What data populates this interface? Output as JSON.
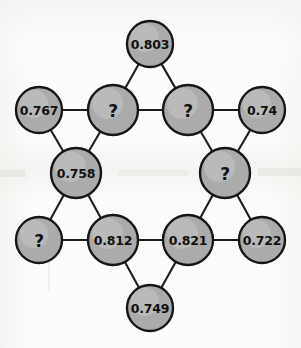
{
  "figure": {
    "background_color": "#fcfcfb",
    "node_fill_color": "#ababab",
    "node_stroke_color": "#161616",
    "edge_color": "#1d1d1d",
    "unknown_marker": "?"
  },
  "chart_data": {
    "type": "diagram",
    "layout": "hexagram",
    "node_count": 12,
    "edge_count": 12,
    "unknown_count": 4,
    "known_count": 8,
    "nodes": [
      {
        "id": "top",
        "label": "0.803",
        "value": 0.803,
        "known": true,
        "cx": 150,
        "cy": 44,
        "r": 23
      },
      {
        "id": "upper-left",
        "label": "0.767",
        "value": 0.767,
        "known": true,
        "cx": 39,
        "cy": 110,
        "r": 23
      },
      {
        "id": "upper-mid-l",
        "label": "?",
        "value": null,
        "known": false,
        "cx": 113,
        "cy": 110,
        "r": 25
      },
      {
        "id": "upper-mid-r",
        "label": "?",
        "value": null,
        "known": false,
        "cx": 188,
        "cy": 110,
        "r": 25
      },
      {
        "id": "upper-right",
        "label": "0.74",
        "value": 0.74,
        "known": true,
        "cx": 262,
        "cy": 110,
        "r": 23
      },
      {
        "id": "mid-left",
        "label": "0.758",
        "value": 0.758,
        "known": true,
        "cx": 76,
        "cy": 173,
        "r": 25
      },
      {
        "id": "mid-right",
        "label": "?",
        "value": null,
        "known": false,
        "cx": 225,
        "cy": 173,
        "r": 25
      },
      {
        "id": "lower-left",
        "label": "?",
        "value": null,
        "known": false,
        "cx": 39,
        "cy": 240,
        "r": 23
      },
      {
        "id": "lower-mid-l",
        "label": "0.812",
        "value": 0.812,
        "known": true,
        "cx": 113,
        "cy": 240,
        "r": 25
      },
      {
        "id": "lower-mid-r",
        "label": "0.821",
        "value": 0.821,
        "known": true,
        "cx": 188,
        "cy": 240,
        "r": 25
      },
      {
        "id": "lower-right",
        "label": "0.722",
        "value": 0.722,
        "known": true,
        "cx": 262,
        "cy": 240,
        "r": 23
      },
      {
        "id": "bottom",
        "label": "0.749",
        "value": 0.749,
        "known": true,
        "cx": 150,
        "cy": 308,
        "r": 23
      }
    ],
    "edges": [
      {
        "from": "top",
        "to": "upper-mid-l"
      },
      {
        "from": "top",
        "to": "upper-mid-r"
      },
      {
        "from": "upper-left",
        "to": "upper-mid-l"
      },
      {
        "from": "upper-mid-l",
        "to": "upper-mid-r"
      },
      {
        "from": "upper-mid-r",
        "to": "upper-right"
      },
      {
        "from": "upper-left",
        "to": "mid-left"
      },
      {
        "from": "upper-mid-l",
        "to": "mid-left"
      },
      {
        "from": "upper-mid-r",
        "to": "mid-right"
      },
      {
        "from": "upper-right",
        "to": "mid-right"
      },
      {
        "from": "mid-left",
        "to": "lower-left"
      },
      {
        "from": "mid-left",
        "to": "lower-mid-l"
      },
      {
        "from": "mid-right",
        "to": "lower-mid-r"
      },
      {
        "from": "mid-right",
        "to": "lower-right"
      },
      {
        "from": "lower-left",
        "to": "lower-mid-l"
      },
      {
        "from": "lower-mid-l",
        "to": "lower-mid-r"
      },
      {
        "from": "lower-mid-r",
        "to": "lower-right"
      },
      {
        "from": "lower-mid-l",
        "to": "bottom"
      },
      {
        "from": "lower-mid-r",
        "to": "bottom"
      }
    ]
  }
}
